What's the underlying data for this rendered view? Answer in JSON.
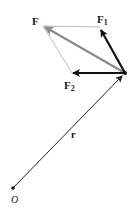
{
  "diagram": {
    "type": "vector-force-parallelogram",
    "colors": {
      "background": "#ffffff",
      "force_component": "#111111",
      "resultant": "#8a8a8a",
      "construction_line": "#b8b8b8",
      "position_vector": "#222222"
    },
    "points": {
      "origin": {
        "x": 13,
        "y": 188
      },
      "application": {
        "x": 125,
        "y": 73
      },
      "F_tip": {
        "x": 43,
        "y": 26
      },
      "F1_tip": {
        "x": 100,
        "y": 28
      },
      "F2_tip": {
        "x": 72,
        "y": 73
      }
    },
    "labels": {
      "F": {
        "text": "F",
        "x": 32,
        "y": 25
      },
      "F1": {
        "text": "F",
        "sub": "1",
        "x": 97,
        "y": 23
      },
      "F2": {
        "text": "F",
        "sub": "2",
        "x": 64,
        "y": 89
      },
      "r": {
        "text": "r",
        "x": 71,
        "y": 138
      },
      "O": {
        "text": "O",
        "x": 11,
        "y": 203
      }
    }
  }
}
